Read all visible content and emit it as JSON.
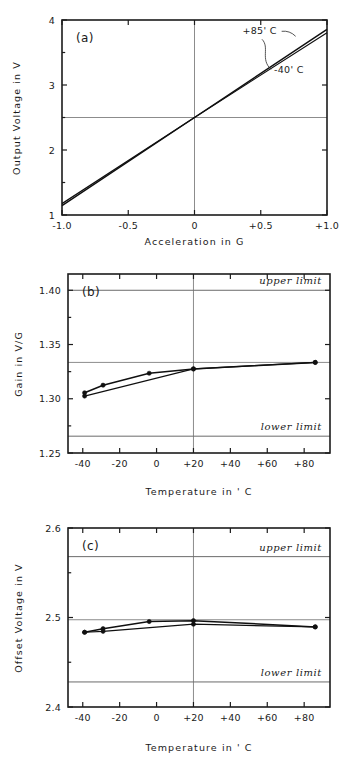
{
  "figure": {
    "panel_count": 3
  },
  "chart_data": [
    {
      "id": "a",
      "type": "line",
      "tag": "(a)",
      "title": "",
      "xlabel": "Acceleration  in  G",
      "ylabel": "Output Voltage  in  V",
      "xlim": [
        -1.0,
        1.0
      ],
      "ylim": [
        1,
        4
      ],
      "xticks": [
        -1.0,
        -0.5,
        0,
        0.5,
        1.0
      ],
      "xticklabels": [
        "-1.0",
        "-0.5",
        "0",
        "+0.5",
        "+1.0"
      ],
      "yticks": [
        1,
        2,
        3,
        4
      ],
      "yticklabels": [
        "1",
        "2",
        "3",
        "4"
      ],
      "yminorticks": [
        1.5,
        2.5,
        3.5
      ],
      "grid": "zero-cross",
      "gridlines_x": [
        0
      ],
      "gridlines_y": [
        2.5
      ],
      "legend_position": "inline-annotation",
      "series": [
        {
          "name": "+85' C",
          "x": [
            -1.0,
            0,
            1.0
          ],
          "values": [
            1.145,
            2.5,
            3.855
          ]
        },
        {
          "name": "-40' C",
          "x": [
            -1.0,
            0,
            1.0
          ],
          "values": [
            1.175,
            2.5,
            3.805
          ]
        }
      ],
      "annotations": [
        {
          "text": "+85' C",
          "x": 0.62,
          "y": 3.78,
          "anchor": "end"
        },
        {
          "text": "-40' C",
          "x": 0.6,
          "y": 3.18,
          "anchor": "start"
        }
      ]
    },
    {
      "id": "b",
      "type": "line",
      "tag": "(b)",
      "title": "",
      "xlabel": "Temperature  in  ' C",
      "ylabel": "Gain  in  V/G",
      "xlim": [
        -48,
        94
      ],
      "ylim": [
        1.25,
        1.415
      ],
      "xticks": [
        -40,
        -20,
        0,
        20,
        40,
        60,
        80
      ],
      "xticklabels": [
        "-40",
        "-20",
        "0",
        "+20",
        "+40",
        "+60",
        "+80"
      ],
      "yticks": [
        1.25,
        1.3,
        1.35,
        1.4
      ],
      "yticklabels": [
        "1.25",
        "1.30",
        "1.35",
        "1.40"
      ],
      "yminorticks": [
        1.275,
        1.325,
        1.375
      ],
      "grid": "zero-cross",
      "gridlines_x": [
        20
      ],
      "gridlines_y": [
        1.3335
      ],
      "limits": {
        "upper": {
          "value": 1.4,
          "label": "upper limit"
        },
        "lower": {
          "value": 1.2655,
          "label": "lower limit"
        }
      },
      "series": [
        {
          "name": "gain-curve-1",
          "x": [
            -39,
            -29,
            -4,
            20,
            86
          ],
          "values": [
            1.3055,
            1.3125,
            1.3235,
            1.3275,
            1.3335
          ]
        },
        {
          "name": "gain-curve-2",
          "x": [
            -39,
            20,
            86
          ],
          "values": [
            1.3025,
            1.3275,
            1.3335
          ]
        }
      ]
    },
    {
      "id": "c",
      "type": "line",
      "tag": "(c)",
      "title": "",
      "xlabel": "Temperature  in  ' C",
      "ylabel": "Offset Voltage  in  V",
      "xlim": [
        -48,
        94
      ],
      "ylim": [
        2.4,
        2.6
      ],
      "xticks": [
        -40,
        -20,
        0,
        20,
        40,
        60,
        80
      ],
      "xticklabels": [
        "-40",
        "-20",
        "0",
        "+20",
        "+40",
        "+60",
        "+80"
      ],
      "yticks": [
        2.4,
        2.5,
        2.6
      ],
      "yticklabels": [
        "2.4",
        "2.5",
        "2.6"
      ],
      "yminorticks": [
        2.45,
        2.55
      ],
      "grid": "zero-cross",
      "gridlines_x": [
        20
      ],
      "gridlines_y": [
        2.4975
      ],
      "limits": {
        "upper": {
          "value": 2.568,
          "label": "upper limit"
        },
        "lower": {
          "value": 2.428,
          "label": "lower limit"
        }
      },
      "series": [
        {
          "name": "offset-curve-1",
          "x": [
            -39,
            -29,
            -4,
            20,
            86
          ],
          "values": [
            2.4835,
            2.4875,
            2.4955,
            2.4965,
            2.4895
          ]
        },
        {
          "name": "offset-curve-2",
          "x": [
            -39,
            -29,
            20,
            86
          ],
          "values": [
            2.4835,
            2.4845,
            2.4925,
            2.4895
          ]
        }
      ]
    }
  ]
}
